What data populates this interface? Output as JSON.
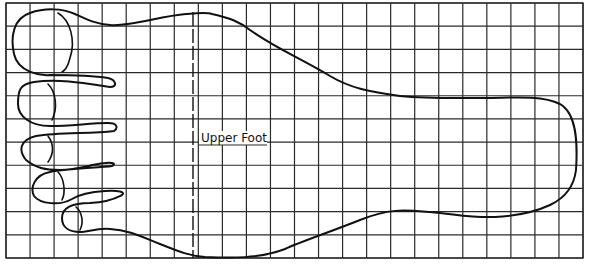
{
  "diagram": {
    "title": "",
    "label": "Upper Foot",
    "colors": {
      "background": "#ffffff",
      "grid": "#2a2a2a",
      "outline": "#111111"
    },
    "grid": {
      "left": 6,
      "top": 3,
      "right": 583,
      "bottom": 258,
      "columns": 24,
      "rows": 11
    },
    "divider": {
      "style": "dashed",
      "x": 193
    },
    "parts": [
      "big-toe",
      "second-toe",
      "third-toe",
      "fourth-toe",
      "little-toe",
      "upper-foot",
      "heel"
    ]
  }
}
